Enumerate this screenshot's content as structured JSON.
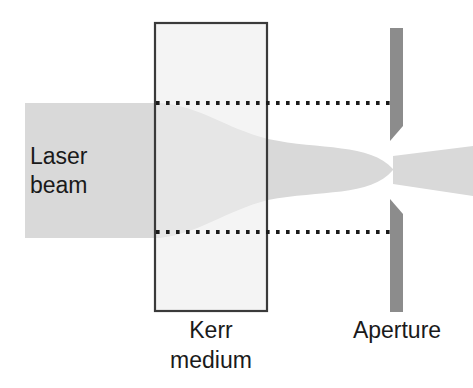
{
  "figure": {
    "background_color": "#ffffff",
    "width": 473,
    "height": 388
  },
  "labels": {
    "laser_beam_line1": "Laser",
    "laser_beam_line2": "beam",
    "kerr_medium_line1": "Kerr",
    "kerr_medium_line2": "medium",
    "aperture": "Aperture"
  },
  "colors": {
    "beam_fill": "#d9d9d9",
    "medium_fill": "#ededed",
    "medium_stroke": "#3a3a3a",
    "aperture_fill": "#8c8c8c",
    "dotted_line": "#1a1a1a",
    "text": "#1a1a1a"
  },
  "elements": {
    "laser_beam": {
      "name": "laser-beam",
      "entry_top_y": 103,
      "entry_bottom_y": 238,
      "exit_top_y": 140,
      "exit_bottom_y": 200,
      "start_x": 25,
      "end_x": 473
    },
    "kerr_medium": {
      "name": "kerr-medium-block",
      "x": 155,
      "y": 23,
      "width": 112,
      "height": 288
    },
    "aperture_upper_blade": {
      "name": "aperture-upper-blade",
      "x": 390,
      "y": 28,
      "width": 13,
      "height": 112
    },
    "aperture_lower_blade": {
      "name": "aperture-lower-blade",
      "x": 390,
      "y": 200,
      "width": 13,
      "height": 112
    },
    "dotted_line_top": {
      "name": "reference-line-top",
      "y": 103,
      "x_start": 155,
      "x_end": 392,
      "dot_count": 25
    },
    "dotted_line_bottom": {
      "name": "reference-line-bottom",
      "y": 232,
      "x_start": 155,
      "x_end": 392,
      "dot_count": 25
    }
  }
}
